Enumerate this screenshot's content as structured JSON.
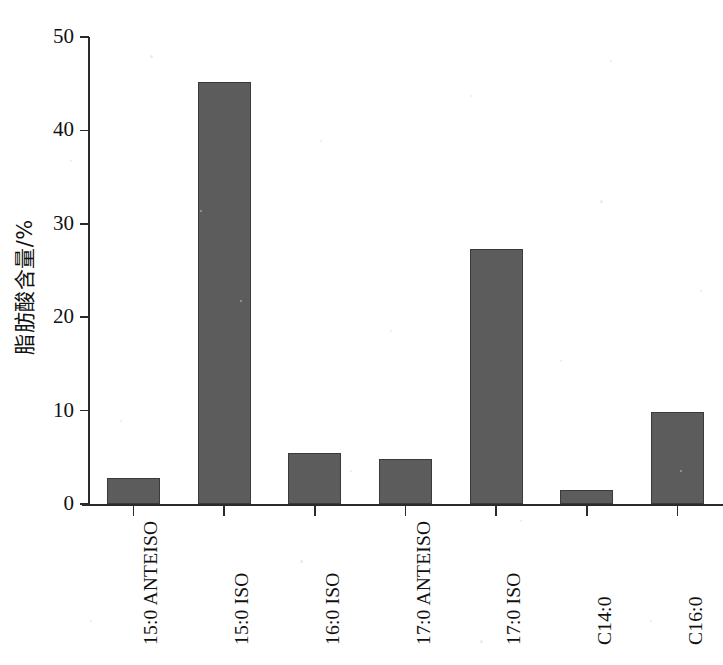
{
  "chart_data": {
    "type": "bar",
    "title": "",
    "xlabel": "",
    "ylabel": "脂肪酸含量/%",
    "categories": [
      "15:0 ANTEISO",
      "15:0 ISO",
      "16:0 ISO",
      "17:0 ANTEISO",
      "17:0 ISO",
      "C14:0",
      "C16:0"
    ],
    "values": [
      2.8,
      45.2,
      5.5,
      4.8,
      27.3,
      1.5,
      9.8
    ],
    "ylim": [
      0,
      50
    ],
    "yticks": [
      0,
      10,
      20,
      30,
      40,
      50
    ],
    "ytick_labels": [
      "0",
      "10",
      "20",
      "30",
      "40",
      "50"
    ],
    "grid": false,
    "legend": null,
    "bar_color": "#5c5c5c",
    "bar_edge_color": "#3a3a3a",
    "axis_color": "#2b2b2b"
  }
}
